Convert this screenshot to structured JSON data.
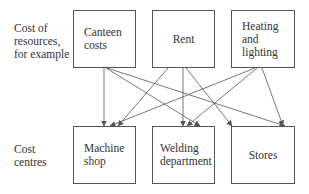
{
  "row_labels": {
    "resources": "Cost of\nresources,\nfor example",
    "centres": "Cost\ncentres"
  },
  "resources": [
    {
      "label": "Canteen\ncosts"
    },
    {
      "label": "Rent"
    },
    {
      "label": "Heating\nand\nlighting"
    }
  ],
  "cost_centres": [
    {
      "label": "Machine\nshop"
    },
    {
      "label": "Welding\ndepartment"
    },
    {
      "label": "Stores"
    }
  ],
  "connections": [
    {
      "from": "Canteen costs",
      "to": "Machine shop"
    },
    {
      "from": "Canteen costs",
      "to": "Welding department"
    },
    {
      "from": "Canteen costs",
      "to": "Stores"
    },
    {
      "from": "Rent",
      "to": "Machine shop"
    },
    {
      "from": "Rent",
      "to": "Welding department"
    },
    {
      "from": "Rent",
      "to": "Stores"
    },
    {
      "from": "Heating and lighting",
      "to": "Machine shop"
    },
    {
      "from": "Heating and lighting",
      "to": "Welding department"
    },
    {
      "from": "Heating and lighting",
      "to": "Stores"
    }
  ],
  "colors": {
    "line": "#555555",
    "text": "#333333"
  }
}
